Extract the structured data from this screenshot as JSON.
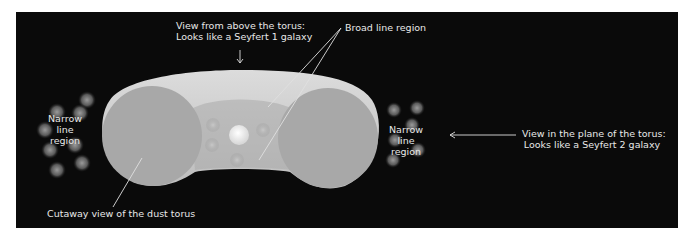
{
  "diagram": {
    "labels": {
      "above_line1": "View from above the torus:",
      "above_line2": "Looks like a Seyfert 1 galaxy",
      "broad_line": "Broad line region",
      "narrow_left_line1": "Narrow",
      "narrow_left_line2": "line",
      "narrow_left_line3": "region",
      "narrow_right_line1": "Narrow",
      "narrow_right_line2": "line",
      "narrow_right_line3": "region",
      "plane_line1": "View in the plane of the torus:",
      "plane_line2": "Looks like a Seyfert 2 galaxy",
      "cutaway": "Cutaway view of the dust torus"
    },
    "colors": {
      "background": "#0a0a0a",
      "torus_light": "#d4d4d4",
      "torus_mid": "#b8b8b8",
      "cross_section": "#a9a9a9",
      "text": "#e8e8e8"
    }
  }
}
